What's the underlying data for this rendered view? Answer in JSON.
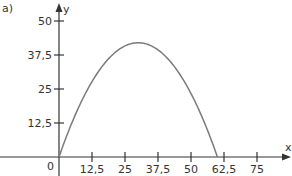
{
  "panel_label": "a)",
  "chart_data": {
    "type": "line",
    "title": "",
    "xlabel": "x",
    "ylabel": "y",
    "origin_label": "0",
    "xlim": [
      0,
      75
    ],
    "ylim": [
      0,
      50
    ],
    "grid": false,
    "legend": null,
    "x_ticks": [
      12.5,
      25,
      37.5,
      50,
      62.5,
      75
    ],
    "x_tick_labels": [
      "12,5",
      "25",
      "37,5",
      "50",
      "62,5",
      "75"
    ],
    "y_ticks": [
      12.5,
      25,
      37.5,
      50
    ],
    "y_tick_labels": [
      "12,5",
      "25",
      "37,5",
      "50"
    ],
    "series": [
      {
        "name": "parabola",
        "description": "Downward-opening parabola through origin, vertex near (30, 42), second root near x = 60",
        "x": [
          0,
          5,
          10,
          15,
          20,
          25,
          30,
          35,
          40,
          45,
          50,
          55,
          60
        ],
        "y": [
          0,
          12.8,
          23.3,
          31.5,
          37.3,
          40.8,
          42,
          40.8,
          37.3,
          31.5,
          23.3,
          12.8,
          0
        ],
        "color": "#7a7a7a"
      }
    ]
  },
  "colors": {
    "axis": "#333333",
    "curve": "#7a7a7a",
    "text": "#333333"
  }
}
